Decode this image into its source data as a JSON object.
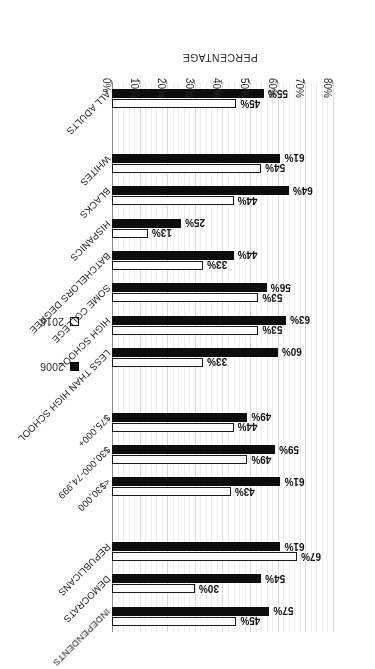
{
  "chart_data": {
    "type": "bar",
    "orientation": "horizontal",
    "title": "",
    "xlabel": "PERCENTAGE",
    "ylabel": "",
    "xlim": [
      0,
      80
    ],
    "xticks": [
      "0%",
      "10%",
      "20%",
      "30%",
      "40%",
      "50%",
      "60%",
      "70%",
      "80%"
    ],
    "xtick_values": [
      0,
      10,
      20,
      30,
      40,
      50,
      60,
      70,
      80
    ],
    "grid": true,
    "legend_position": "top-left",
    "value_label_suffix": "%",
    "categories": [
      "ALL ADULTS",
      "WHITES",
      "BLACKS",
      "HISPANICS",
      "BATCHELORS DEGREE",
      "SOME COLLEGE",
      "HIGH SCHOOL",
      "LESS THAN HIGH SCHOOL",
      "$75,000+",
      "$30,000-74,999",
      "<$30,000",
      "REPUBLICANS",
      "DEMOCRATS",
      "INDEPENDENTS"
    ],
    "series": [
      {
        "name": "2006",
        "color": "#0d0d0d",
        "values": [
          55,
          61,
          64,
          25,
          44,
          56,
          63,
          60,
          49,
          59,
          61,
          61,
          54,
          57
        ],
        "labels": [
          "55%",
          "61%",
          "64%",
          "25%",
          "44%",
          "56%",
          "63%",
          "60%",
          "49%",
          "59%",
          "61%",
          "61%",
          "54%",
          "57%"
        ]
      },
      {
        "name": "2016",
        "color": "#ffffff",
        "values": [
          45,
          54,
          44,
          13,
          33,
          53,
          53,
          33,
          44,
          49,
          43,
          67,
          30,
          45
        ],
        "labels": [
          "45%",
          "54%",
          "44%",
          "13%",
          "33%",
          "53%",
          "53%",
          "33%",
          "44%",
          "49%",
          "43%",
          "67%",
          "30%",
          "45%"
        ]
      }
    ],
    "groups": [
      {
        "name": "overall",
        "categories": [
          "ALL ADULTS"
        ]
      },
      {
        "name": "race",
        "categories": [
          "WHITES",
          "BLACKS",
          "HISPANICS"
        ]
      },
      {
        "name": "education",
        "categories": [
          "BATCHELORS DEGREE",
          "SOME COLLEGE",
          "HIGH SCHOOL",
          "LESS THAN HIGH SCHOOL"
        ]
      },
      {
        "name": "income",
        "categories": [
          "$75,000+",
          "$30,000-74,999",
          "<$30,000"
        ]
      },
      {
        "name": "party",
        "categories": [
          "REPUBLICANS",
          "DEMOCRATS",
          "INDEPENDENTS"
        ]
      }
    ]
  },
  "legend": {
    "entries": [
      {
        "label": "2006",
        "swatch": "filled-square-icon"
      },
      {
        "label": "2016",
        "swatch": "open-square-icon"
      }
    ]
  },
  "axis": {
    "title": "PERCENTAGE"
  }
}
